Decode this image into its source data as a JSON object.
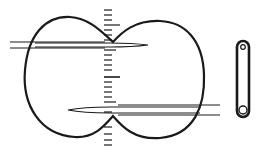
{
  "figure": {
    "type": "line-art diagram",
    "elements": [
      {
        "name": "dumbbell-shaped-outline",
        "shape": "two-lobed closed curve"
      },
      {
        "name": "vertical-scale",
        "tick_count": 22
      },
      {
        "name": "upper-needle",
        "direction": "points right"
      },
      {
        "name": "lower-needle",
        "direction": "points left"
      },
      {
        "name": "link-bar",
        "shape": "elongated rounded bar with two holes"
      }
    ],
    "colors": {
      "stroke": "#1a1a1a",
      "background": "#ffffff"
    }
  }
}
